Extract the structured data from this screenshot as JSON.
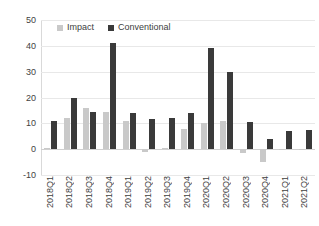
{
  "chart_data": {
    "type": "bar",
    "title": "",
    "xlabel": "",
    "ylabel": "",
    "ylim": [
      -10,
      50
    ],
    "yticks": [
      -10,
      0,
      10,
      20,
      30,
      40,
      50
    ],
    "ytick_labels": [
      "-10",
      "0",
      "10",
      "20",
      "30",
      "40",
      "50"
    ],
    "grid": true,
    "legend_position": "top-left-inside",
    "categories": [
      "2018Q1",
      "2018Q2",
      "2018Q3",
      "2018Q4",
      "2019Q1",
      "2019Q2",
      "2019Q3",
      "2019Q4",
      "2020Q1",
      "2020Q2",
      "2020Q3",
      "2020Q4",
      "2021Q1",
      "2021Q2"
    ],
    "series": [
      {
        "name": "Impact",
        "color": "#c9c9c9",
        "values": [
          0.5,
          12,
          16,
          14.5,
          11,
          -1,
          0.3,
          8,
          10,
          11,
          -1.5,
          -5,
          -0.5,
          -0.3
        ]
      },
      {
        "name": "Conventional",
        "color": "#3a3a3a",
        "values": [
          11,
          20,
          14.5,
          41,
          14,
          11.5,
          12,
          14,
          39,
          30,
          10.5,
          4,
          7,
          7.5
        ]
      }
    ]
  },
  "legend": {
    "items": [
      {
        "label": "Impact",
        "color": "#c9c9c9"
      },
      {
        "label": "Conventional",
        "color": "#3a3a3a"
      }
    ]
  }
}
